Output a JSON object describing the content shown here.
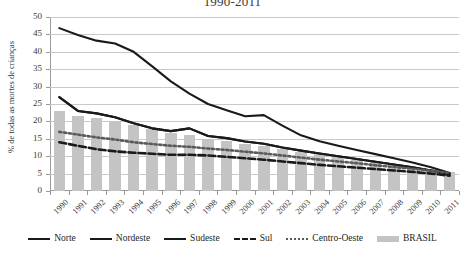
{
  "chart_data": {
    "type": "line",
    "title": "1990-2011",
    "xlabel": "",
    "ylabel": "% de todas as mortes de crianças",
    "ylim": [
      0,
      50
    ],
    "yticks": [
      0,
      5,
      10,
      15,
      20,
      25,
      30,
      35,
      40,
      45,
      50
    ],
    "grid": true,
    "legend_position": "bottom",
    "categories": [
      "1990",
      "1991",
      "1992",
      "1993",
      "1994",
      "1995",
      "1996",
      "1997",
      "1998",
      "1999",
      "2000",
      "2001",
      "2002",
      "2003",
      "2004",
      "2005",
      "2006",
      "2007",
      "2008",
      "2009",
      "2010",
      "2011"
    ],
    "series": [
      {
        "name": "Norte",
        "style": "solid",
        "color": "#1a1a1a",
        "values": [
          27.0,
          23.0,
          22.3,
          21.2,
          19.5,
          18.0,
          17.2,
          18.0,
          15.8,
          15.2,
          14.2,
          13.6,
          12.5,
          11.6,
          10.8,
          10.0,
          9.2,
          8.4,
          7.6,
          6.8,
          5.9,
          5.0
        ]
      },
      {
        "name": "Nordeste",
        "style": "solid",
        "color": "#1a1a1a",
        "values": [
          27.0,
          23.0,
          22.3,
          21.2,
          19.5,
          18.0,
          17.2,
          18.0,
          15.8,
          15.2,
          14.2,
          13.6,
          12.5,
          11.6,
          10.8,
          10.0,
          9.2,
          8.4,
          7.6,
          6.8,
          5.9,
          4.6
        ]
      },
      {
        "name": "Sudeste",
        "style": "solid",
        "color": "#1a1a1a",
        "values": [
          46.8,
          44.8,
          43.2,
          42.4,
          40.0,
          35.8,
          31.5,
          28.0,
          25.0,
          23.2,
          21.5,
          21.8,
          18.8,
          16.0,
          14.3,
          13.0,
          11.8,
          10.6,
          9.4,
          8.2,
          6.8,
          5.2
        ]
      },
      {
        "name": "Sul",
        "style": "dashed",
        "color": "#1a1a1a",
        "values": [
          14.0,
          13.0,
          12.0,
          11.4,
          11.0,
          10.7,
          10.4,
          10.4,
          10.2,
          9.8,
          9.4,
          9.0,
          8.5,
          8.0,
          7.5,
          7.1,
          6.7,
          6.3,
          5.9,
          5.5,
          5.0,
          4.4
        ]
      },
      {
        "name": "Centro-Oeste",
        "style": "dotted",
        "color": "#5a5a5a",
        "values": [
          17.0,
          16.2,
          15.4,
          14.8,
          14.0,
          13.5,
          13.0,
          12.7,
          12.2,
          11.8,
          11.3,
          10.8,
          10.2,
          9.6,
          9.0,
          8.5,
          8.0,
          7.4,
          6.9,
          6.4,
          5.8,
          5.2
        ]
      }
    ],
    "bar_series": {
      "name": "BRASIL",
      "color": "#c4c4c4",
      "values": [
        23.0,
        21.5,
        21.0,
        20.2,
        19.0,
        17.8,
        16.8,
        16.0,
        15.0,
        14.3,
        13.5,
        12.8,
        12.0,
        11.2,
        10.5,
        9.8,
        9.0,
        8.3,
        7.6,
        7.0,
        6.2,
        5.4
      ]
    }
  },
  "legend": {
    "items": [
      {
        "label": "Norte",
        "marker": "solid-line"
      },
      {
        "label": "Nordeste",
        "marker": "solid-line"
      },
      {
        "label": "Sudeste",
        "marker": "solid-line"
      },
      {
        "label": "Sul",
        "marker": "dashed-line"
      },
      {
        "label": "Centro-Oeste",
        "marker": "dotted-line"
      },
      {
        "label": "BRASIL",
        "marker": "gray-bar"
      }
    ]
  }
}
